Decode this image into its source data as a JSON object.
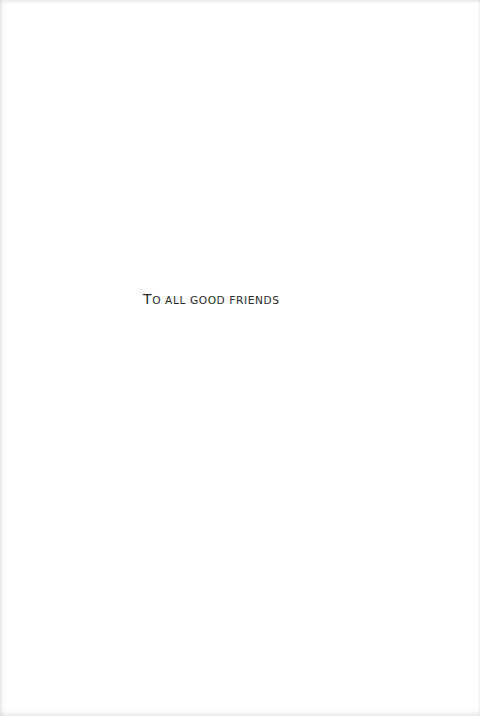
{
  "page": {
    "type": "dedication",
    "dedication": {
      "initial": "T",
      "rest": "o all good friends",
      "full_text": "To all good friends"
    }
  }
}
